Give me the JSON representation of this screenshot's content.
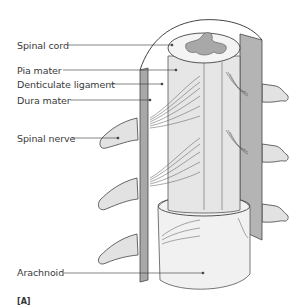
{
  "figure": {
    "panel_label": "[A]",
    "labels": [
      {
        "id": "spinal-cord",
        "text": "Spinal cord",
        "x": 17,
        "y": 40
      },
      {
        "id": "pia-mater",
        "text": "Pia mater",
        "x": 17,
        "y": 65
      },
      {
        "id": "denticulate-ligament",
        "text": "Denticulate ligament",
        "x": 17,
        "y": 79
      },
      {
        "id": "dura-mater",
        "text": "Dura mater",
        "x": 17,
        "y": 96
      },
      {
        "id": "spinal-nerve",
        "text": "Spinal nerve",
        "x": 17,
        "y": 133
      },
      {
        "id": "arachnoid",
        "text": "Arachnoid",
        "x": 17,
        "y": 268
      }
    ],
    "colors": {
      "dura": "#b4b4b4",
      "dura_dark": "#8c8c8c",
      "pia": "#e6e6e6",
      "nerve": "#e2e2e2",
      "grey_matter": "#a8a8a8",
      "outline": "#3c3c3c",
      "background": "#ffffff"
    }
  }
}
